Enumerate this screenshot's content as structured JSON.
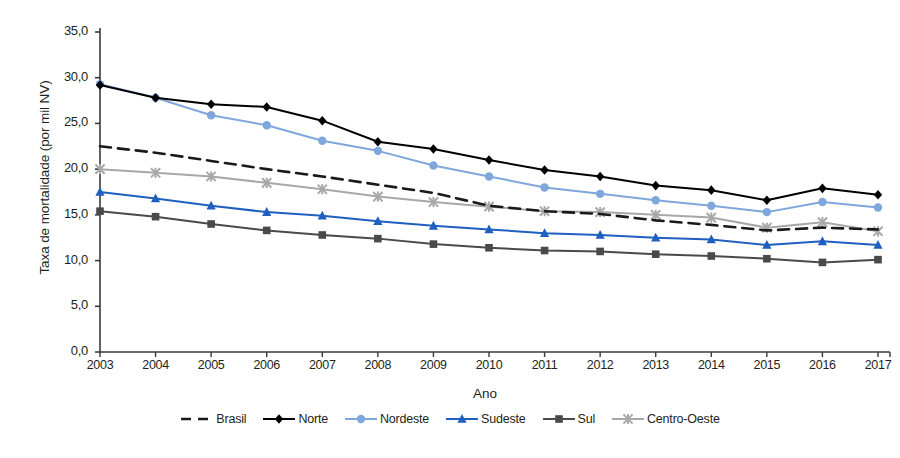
{
  "chart_data": {
    "type": "line",
    "title": "",
    "xlabel": "Ano",
    "ylabel": "Taxa de mortalidade (por mil NV)",
    "categories": [
      "2003",
      "2004",
      "2005",
      "2006",
      "2007",
      "2008",
      "2009",
      "2010",
      "2011",
      "2012",
      "2013",
      "2014",
      "2015",
      "2016",
      "2017"
    ],
    "x": [
      2003,
      2004,
      2005,
      2006,
      2007,
      2008,
      2009,
      2010,
      2011,
      2012,
      2013,
      2014,
      2015,
      2016,
      2017
    ],
    "ylim": [
      0,
      35
    ],
    "xlim": [
      2003,
      2017
    ],
    "ytick_labels": [
      "35,0",
      "30,0",
      "25,0",
      "20,0",
      "15,0",
      "10,0",
      "5,0",
      "0,0"
    ],
    "ytick_values": [
      35,
      30,
      25,
      20,
      15,
      10,
      5,
      0
    ],
    "grid": false,
    "legend_position": "bottom",
    "series": [
      {
        "name": "Brasil",
        "color": "#1a1a1a",
        "style": "dashed",
        "marker": "none",
        "values": [
          22.5,
          21.8,
          20.9,
          20.0,
          19.2,
          18.3,
          17.4,
          16.0,
          15.4,
          15.1,
          14.4,
          13.9,
          13.3,
          13.6,
          13.4
        ]
      },
      {
        "name": "Norte",
        "color": "#000000",
        "style": "solid",
        "marker": "diamond",
        "values": [
          29.2,
          27.8,
          27.1,
          26.8,
          25.3,
          23.0,
          22.2,
          21.0,
          19.9,
          19.2,
          18.2,
          17.7,
          16.6,
          17.9,
          17.2
        ]
      },
      {
        "name": "Nordeste",
        "color": "#7fa7dc",
        "style": "solid",
        "marker": "circle",
        "values": [
          29.3,
          27.8,
          25.9,
          24.8,
          23.1,
          22.0,
          20.4,
          19.2,
          18.0,
          17.3,
          16.6,
          16.0,
          15.3,
          16.4,
          15.8
        ]
      },
      {
        "name": "Sudeste",
        "color": "#1f5fc0",
        "style": "solid",
        "marker": "triangle",
        "values": [
          17.5,
          16.8,
          16.0,
          15.3,
          14.9,
          14.3,
          13.8,
          13.4,
          13.0,
          12.8,
          12.5,
          12.3,
          11.7,
          12.1,
          11.7
        ]
      },
      {
        "name": "Sul",
        "color": "#4a4a4a",
        "style": "solid",
        "marker": "square",
        "values": [
          15.4,
          14.8,
          14.0,
          13.3,
          12.8,
          12.4,
          11.8,
          11.4,
          11.1,
          11.0,
          10.7,
          10.5,
          10.2,
          9.8,
          10.1
        ]
      },
      {
        "name": "Centro-Oeste",
        "color": "#a8a8a8",
        "style": "solid",
        "marker": "x",
        "values": [
          20.0,
          19.6,
          19.2,
          18.5,
          17.8,
          17.0,
          16.4,
          15.9,
          15.4,
          15.3,
          15.0,
          14.7,
          13.6,
          14.2,
          13.2
        ]
      }
    ]
  },
  "axes": {
    "y_title": "Taxa de mortalidade (por mil NV)",
    "x_title": "Ano"
  }
}
